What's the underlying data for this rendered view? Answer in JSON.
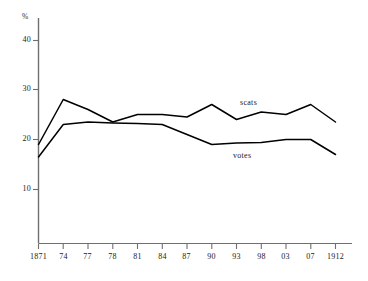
{
  "chart_data": {
    "type": "line",
    "title": "",
    "xlabel": "",
    "ylabel": "%",
    "ylim": [
      0,
      45
    ],
    "yticks": [
      10,
      20,
      30,
      40
    ],
    "ytick_labels": [
      "10",
      "20",
      "30",
      "40"
    ],
    "grid": false,
    "legend_position": "inline-annotations",
    "categories": [
      "1871",
      "74",
      "77",
      "78",
      "81",
      "84",
      "87",
      "90",
      "93",
      "98",
      "03",
      "07",
      "1912"
    ],
    "series": [
      {
        "name": "scats",
        "label": "scats",
        "color": "#000000",
        "values": [
          19.0,
          28.0,
          26.0,
          23.5,
          25.0,
          25.0,
          24.5,
          27.0,
          24.0,
          25.5,
          25.0,
          27.0,
          23.5
        ]
      },
      {
        "name": "votes",
        "label": "votes",
        "color": "#000000",
        "values": [
          16.5,
          23.0,
          23.5,
          23.3,
          23.2,
          23.0,
          21.0,
          19.0,
          19.3,
          19.4,
          20.0,
          20.0,
          17.0
        ]
      }
    ],
    "annotations": [
      {
        "text": "scats",
        "x_px": 240,
        "y_px": 99
      },
      {
        "text": "votes",
        "x_px": 233,
        "y_px": 152
      }
    ]
  },
  "axes": {
    "unit_label": "%",
    "y_tick_labels": [
      "40",
      "30",
      "20",
      "10"
    ],
    "x_tick_labels": [
      "1871",
      "74",
      "77",
      "78",
      "81",
      "84",
      "87",
      "90",
      "93",
      "98",
      "03",
      "07",
      "1912"
    ]
  },
  "caption": {
    "text": ""
  }
}
